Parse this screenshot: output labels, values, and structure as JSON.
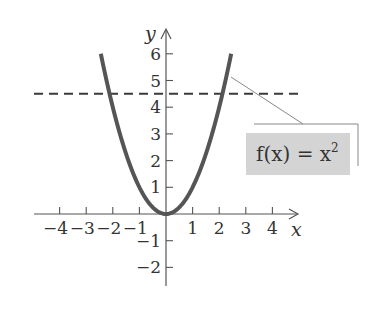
{
  "chart_data": {
    "type": "line",
    "title": "",
    "xlabel": "x",
    "ylabel": "y",
    "xlim": [
      -4.9,
      4.9
    ],
    "ylim": [
      -3,
      7
    ],
    "grid": false,
    "x_ticks": [
      -4,
      -3,
      -2,
      -1,
      1,
      2,
      3,
      4
    ],
    "x_tick_labels": [
      "−4",
      "−3",
      "−2",
      "−1",
      "1",
      "2",
      "3",
      "4"
    ],
    "y_ticks": [
      -2,
      -1,
      1,
      2,
      3,
      4,
      5,
      6
    ],
    "y_tick_labels": [
      "−2",
      "−1",
      "1",
      "2",
      "3",
      "4",
      "5",
      "6"
    ],
    "series": [
      {
        "name": "f(x) = x^2",
        "style": "solid",
        "color": "#555555",
        "x": [
          -2.45,
          -2,
          -1.5,
          -1,
          -0.5,
          0,
          0.5,
          1,
          1.5,
          2,
          2.45
        ],
        "values": [
          6.0,
          4.0,
          2.25,
          1.0,
          0.25,
          0,
          0.25,
          1.0,
          2.25,
          4.0,
          6.0
        ]
      },
      {
        "name": "y = 4.5",
        "style": "dashed",
        "color": "#333333",
        "x": [
          -5,
          5
        ],
        "values": [
          4.5,
          4.5
        ]
      }
    ],
    "annotations": [
      {
        "text": "f(x) = x²",
        "base": "f(x) = x",
        "exponent": "2",
        "points_to": [
          2.35,
          5.2
        ],
        "background": "#d4d4d4"
      }
    ]
  },
  "labels": {
    "x_axis": "x",
    "y_axis": "y",
    "fn_base": "f(x) = x",
    "fn_exp": "2"
  },
  "colors": {
    "curve": "#555555",
    "axis": "#555555",
    "dash": "#3a3a3a",
    "label_bg": "#d4d4d4",
    "leader": "#888888"
  }
}
